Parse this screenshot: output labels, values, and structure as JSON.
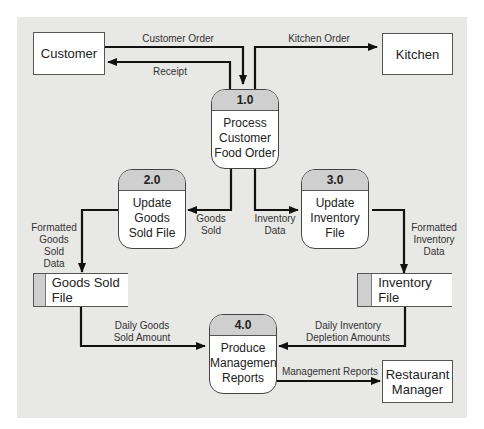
{
  "diagram": {
    "type": "data-flow-diagram",
    "colors": {
      "panel": "#e8e8e6",
      "process_header": "#cfcfcf",
      "line": "#111111"
    },
    "external_entities": [
      {
        "id": "customer",
        "label": "Customer"
      },
      {
        "id": "kitchen",
        "label": "Kitchen"
      },
      {
        "id": "manager",
        "label": "Restaurant\nManager"
      }
    ],
    "processes": [
      {
        "id": "1.0",
        "name": "Process\nCustomer\nFood Order"
      },
      {
        "id": "2.0",
        "name": "Update\nGoods\nSold File"
      },
      {
        "id": "3.0",
        "name": "Update\nInventory\nFile"
      },
      {
        "id": "4.0",
        "name": "Produce\nManagement\nReports"
      }
    ],
    "data_stores": [
      {
        "id": "goods",
        "label": "Goods Sold File"
      },
      {
        "id": "inventory",
        "label": "Inventory File"
      }
    ],
    "flows": [
      {
        "from": "Customer",
        "to": "1.0",
        "label": "Customer Order"
      },
      {
        "from": "1.0",
        "to": "Customer",
        "label": "Receipt"
      },
      {
        "from": "1.0",
        "to": "Kitchen",
        "label": "Kitchen Order"
      },
      {
        "from": "1.0",
        "to": "2.0",
        "label": "Goods\nSold"
      },
      {
        "from": "1.0",
        "to": "3.0",
        "label": "Inventory\nData"
      },
      {
        "from": "2.0",
        "to": "Goods Sold File",
        "label": "Formatted\nGoods Sold\nData"
      },
      {
        "from": "3.0",
        "to": "Inventory File",
        "label": "Formatted\nInventory\nData"
      },
      {
        "from": "Goods Sold File",
        "to": "4.0",
        "label": "Daily Goods\nSold Amount"
      },
      {
        "from": "Inventory File",
        "to": "4.0",
        "label": "Daily Inventory\nDepletion Amounts"
      },
      {
        "from": "4.0",
        "to": "Restaurant Manager",
        "label": "Management Reports"
      }
    ]
  }
}
